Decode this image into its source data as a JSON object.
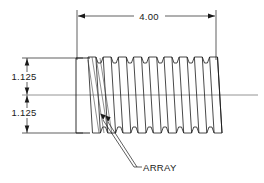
{
  "drawing": {
    "title": "Threaded shaft array section view",
    "background_color": "#ffffff",
    "line_color": "#1a1a1a",
    "thin_line_color": "#555555",
    "centerline_color": "#777777"
  },
  "dimensions": {
    "length": {
      "label": "4.00",
      "name": "overall-length-dimension",
      "orientation": "horizontal",
      "units": "in"
    },
    "upper_radius": {
      "label": "1.125",
      "name": "upper-radius-dimension",
      "orientation": "vertical",
      "units": "in"
    },
    "lower_radius": {
      "label": "1.125",
      "name": "lower-radius-dimension",
      "orientation": "vertical",
      "units": "in"
    }
  },
  "annotations": {
    "array_note": {
      "label": "ARRAY",
      "name": "array-leader-note"
    }
  },
  "geometry": {
    "thread_count": 9,
    "thread_pitch_px": 15.2,
    "thread_start_x": 88,
    "thread_end_x": 224,
    "crest_y_top": 57,
    "crest_y_bottom": 133,
    "root_inset": 6,
    "centerline_y": 95,
    "centerline_x_start": 22,
    "centerline_x_end": 258,
    "body_left_x": 76,
    "dim_line_y": 16,
    "vdim_x": 27
  },
  "chart_data": {
    "type": "table",
    "categories": [
      "Overall length",
      "Upper radius",
      "Lower radius",
      "Callout"
    ],
    "values": [
      "4.00",
      "1.125",
      "1.125",
      "ARRAY"
    ]
  }
}
